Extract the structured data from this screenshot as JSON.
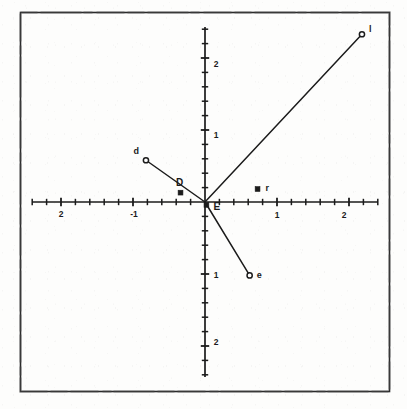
{
  "figure": {
    "title": "",
    "background_color": "#fdfdfc",
    "ink_color": "#1b1b1b",
    "frame": {
      "visible": true,
      "x": 20,
      "y": 12,
      "width": 370,
      "height": 380
    }
  },
  "chart_data": {
    "type": "scatter",
    "title": "",
    "xlabel": "",
    "ylabel": "",
    "xlim": [
      -2.4,
      2.4
    ],
    "ylim": [
      -2.45,
      2.45
    ],
    "grid": false,
    "legend": null,
    "axes": {
      "x_tick_labels": [
        "2",
        "-1",
        "1",
        "2"
      ],
      "x_tick_values": [
        -2,
        -1,
        1,
        2
      ],
      "y_tick_labels": [
        "2",
        "1",
        "1",
        "2"
      ],
      "y_tick_values": [
        2,
        1,
        -1,
        -2
      ],
      "minor_tick_step": 0.2,
      "x_axis_range": [
        -2.4,
        2.4
      ],
      "y_axis_range": [
        -2.43,
        2.43
      ]
    },
    "points": [
      {
        "label": "l",
        "x": 2.18,
        "y": 2.33,
        "marker": "open-circle",
        "connected_to_origin": true
      },
      {
        "label": "d",
        "x": -0.82,
        "y": 0.58,
        "marker": "open-circle",
        "connected_to_origin": true
      },
      {
        "label": "e",
        "x": 0.62,
        "y": -1.02,
        "marker": "open-circle",
        "connected_to_origin": true
      },
      {
        "label": "D",
        "x": -0.34,
        "y": 0.13,
        "marker": "filled-square",
        "connected_to_origin": false
      },
      {
        "label": "r",
        "x": 0.73,
        "y": 0.18,
        "marker": "filled-square",
        "connected_to_origin": false
      },
      {
        "label": "E",
        "x": 0.02,
        "y": -0.04,
        "marker": "filled-square",
        "connected_to_origin": false
      }
    ],
    "segments": [
      {
        "from": "origin",
        "to": "l"
      },
      {
        "from": "origin",
        "to": "d"
      },
      {
        "from": "origin",
        "to": "e"
      }
    ]
  }
}
